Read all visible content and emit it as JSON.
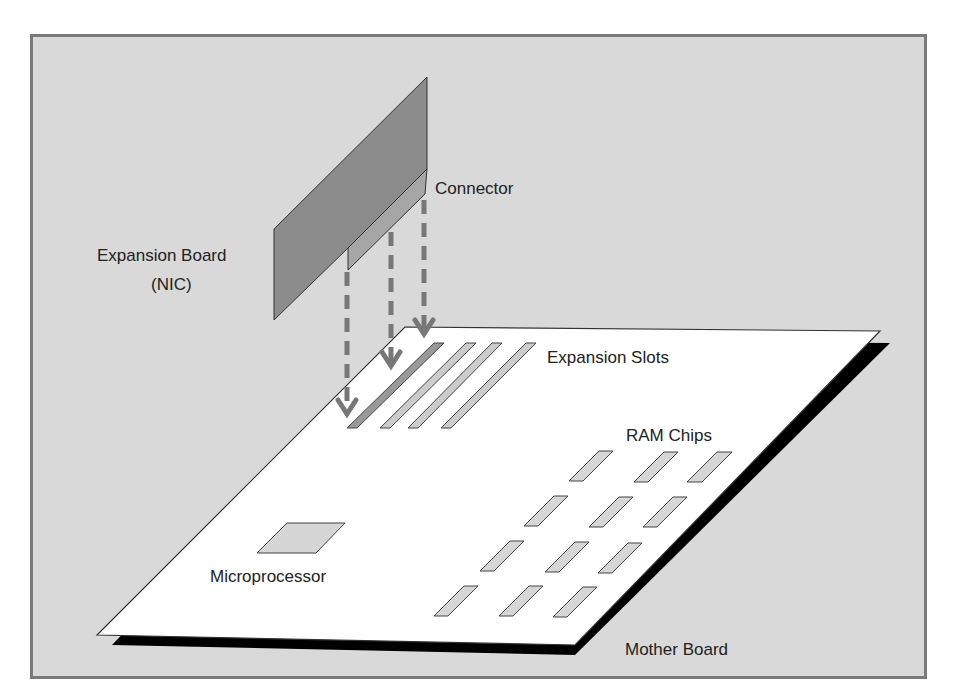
{
  "diagram": {
    "labels": {
      "connector": "Connector",
      "expansion_board_line1": "Expansion Board",
      "expansion_board_line2": "(NIC)",
      "expansion_slots": "Expansion Slots",
      "ram_chips": "RAM Chips",
      "microprocessor": "Microprocessor",
      "mother_board": "Mother Board"
    },
    "colors": {
      "background": "#d9d9d9",
      "frame_border": "#7a7a7a",
      "board": "#ffffff",
      "board_shadow": "#000000",
      "expansion_card": "#8c8c8c",
      "connector": "#a6a6a6",
      "slot_active": "#999999",
      "slot": "#cccccc",
      "chip": "#d6d6d6",
      "arrow": "#777777"
    }
  }
}
